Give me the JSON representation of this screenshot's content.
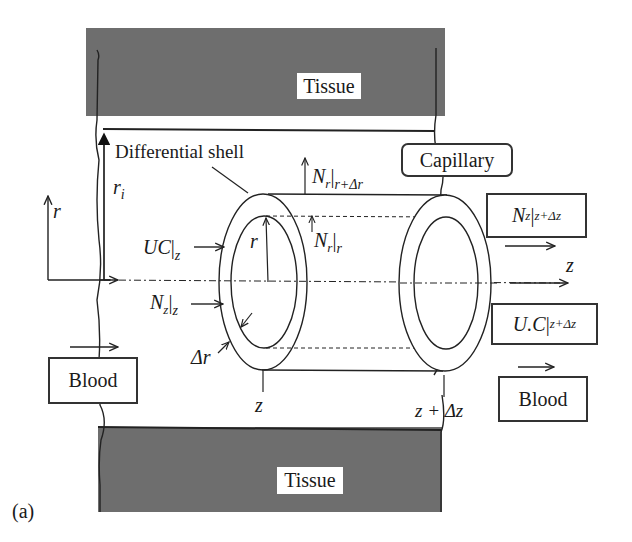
{
  "figure": {
    "panel_label": "(a)",
    "regions": {
      "tissue_top": "Tissue",
      "tissue_bottom": "Tissue",
      "capillary": "Capillary",
      "blood_left": "Blood",
      "blood_right": "Blood"
    },
    "shell_label": "Differential shell",
    "axes": {
      "r_axis": "r",
      "z_axis": "z",
      "ri": "r",
      "ri_sub": "i"
    },
    "fluxes": {
      "uc_z": {
        "main": "UC",
        "bar": "|",
        "sub": "z"
      },
      "nz_z": {
        "main": "N",
        "main_sub": "z",
        "bar": "|",
        "sub": "z"
      },
      "nr_r": {
        "main": "N",
        "main_sub": "r",
        "bar": "|",
        "sub": "r"
      },
      "nr_r_dr": {
        "main": "N",
        "main_sub": "r",
        "bar": "|",
        "sub": "r+Δr"
      },
      "nz_z_dz": {
        "main": "N",
        "main_sub": "z",
        "bar": "|",
        "sub": "z+Δz"
      },
      "uc_z_dz": {
        "main": "U.C",
        "bar": "|",
        "sub": "z+Δz"
      }
    },
    "dimensions": {
      "radius": "r",
      "delta_r": "Δr",
      "z_start": "z",
      "z_end": "z + Δz"
    },
    "colors": {
      "tissue": "#6e6e6e",
      "line": "#222222",
      "background": "#ffffff"
    }
  }
}
